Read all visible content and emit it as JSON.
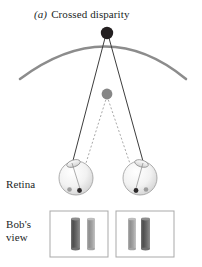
{
  "figure": {
    "panel_letter": "(a)",
    "caption": "Crossed disparity",
    "background_color": "#ffffff",
    "text_color": "#221f1f"
  },
  "labels": {
    "retina": "Retina",
    "bobs_view_line1": "Bob's",
    "bobs_view_line2": "view"
  },
  "scene": {
    "horopter": {
      "name": "horopter-arc",
      "color": "#8c8c8c",
      "stroke_width": 2.6,
      "left_end": {
        "x": 20,
        "y": 78
      },
      "apex": {
        "x": 107,
        "y": 33
      },
      "right_end": {
        "x": 186,
        "y": 78
      }
    },
    "fixation_point": {
      "name": "fixation-dot",
      "label": "far black fixation dot on horopter",
      "x": 107,
      "y": 33,
      "r": 6.2,
      "color": "#231f20"
    },
    "near_point": {
      "name": "near-dot",
      "label": "near gray test dot inside horopter",
      "x": 107,
      "y": 94,
      "r": 5.4,
      "color": "#868686"
    },
    "solid_rays": {
      "name": "fixation-sight-lines",
      "color": "#3b3b3b",
      "stroke_width": 1.0,
      "style": "solid"
    },
    "dashed_rays": {
      "name": "near-point-sight-lines",
      "color": "#9b9b9b",
      "stroke_width": 0.9,
      "style": "dashed",
      "dash_pattern": "2,2"
    },
    "left_eye": {
      "name": "left-eye",
      "cx": 76,
      "cy": 178,
      "r": 17,
      "fill_light": "#fdfdfd",
      "fill_shade": "#d8d8d8",
      "outline": "#8f8f8f"
    },
    "right_eye": {
      "name": "right-eye",
      "cx": 140,
      "cy": 178,
      "r": 17,
      "fill_light": "#fdfdfd",
      "fill_shade": "#d8d8d8",
      "outline": "#8f8f8f"
    },
    "retinal_images": {
      "dark_dot_color": "#2d2a2b",
      "light_dot_color": "#9a9a9a",
      "r": 2.3
    }
  },
  "bobs_view": {
    "box_stroke": "#a9a9a9",
    "box_fill": "#ffffff",
    "left_box": {
      "name": "left-eye-view-box",
      "x": 50,
      "y": 211,
      "width": 58,
      "height": 46,
      "bars": [
        {
          "name": "near-bar",
          "x": 21,
          "width": 9,
          "height": 30,
          "top_color": "#6d6d6d",
          "mid_color": "#4a4a4a",
          "bottom_color": "#777777",
          "shade": "dark"
        },
        {
          "name": "far-bar",
          "x": 37,
          "width": 8,
          "height": 30,
          "top_color": "#a8a8a8",
          "mid_color": "#8a8a8a",
          "bottom_color": "#b0b0b0",
          "shade": "light"
        }
      ]
    },
    "right_box": {
      "name": "right-eye-view-box",
      "x": 116,
      "y": 211,
      "width": 58,
      "height": 46,
      "bars": [
        {
          "name": "far-bar",
          "x": 12,
          "width": 8,
          "height": 30,
          "top_color": "#a8a8a8",
          "mid_color": "#8a8a8a",
          "bottom_color": "#b0b0b0",
          "shade": "light"
        },
        {
          "name": "near-bar",
          "x": 25,
          "width": 9,
          "height": 30,
          "top_color": "#6d6d6d",
          "mid_color": "#4a4a4a",
          "bottom_color": "#777777",
          "shade": "dark"
        }
      ]
    }
  }
}
